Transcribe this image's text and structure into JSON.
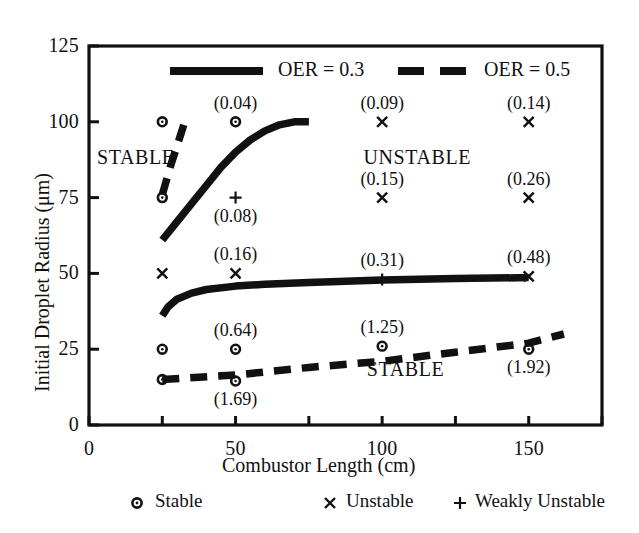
{
  "chart_data": {
    "type": "line",
    "title": "",
    "xlabel": "Combustor Length (cm)",
    "ylabel": "Initial Droplet Radius (μm)",
    "xlim": [
      0,
      175
    ],
    "ylim": [
      0,
      125
    ],
    "xticks": [
      0,
      25,
      50,
      75,
      100,
      125,
      150,
      175
    ],
    "xtick_labels": [
      "0",
      "",
      "50",
      "",
      "100",
      "",
      "150",
      ""
    ],
    "yticks": [
      0,
      25,
      50,
      75,
      100,
      125
    ],
    "ytick_labels": [
      "0",
      "25",
      "50",
      "75",
      "100",
      "125"
    ],
    "grid": false,
    "legend_position": "top-inside",
    "series": [
      {
        "name": "OER = 0.3",
        "style": "solid",
        "branches": [
          {
            "name": "upper-boundary",
            "points": [
              [
                25,
                61
              ],
              [
                30,
                67
              ],
              [
                35,
                73
              ],
              [
                40,
                79
              ],
              [
                45,
                85
              ],
              [
                50,
                90
              ],
              [
                55,
                94
              ],
              [
                60,
                97
              ],
              [
                65,
                99
              ],
              [
                70,
                100
              ],
              [
                75,
                100
              ]
            ]
          },
          {
            "name": "lower-boundary",
            "points": [
              [
                25,
                36
              ],
              [
                27,
                39
              ],
              [
                30,
                41.5
              ],
              [
                35,
                43.5
              ],
              [
                40,
                44.7
              ],
              [
                50,
                45.8
              ],
              [
                60,
                46.4
              ],
              [
                75,
                47
              ],
              [
                100,
                47.8
              ],
              [
                125,
                48.3
              ],
              [
                150,
                48.6
              ]
            ]
          }
        ]
      },
      {
        "name": "OER = 0.5",
        "style": "dashed",
        "branches": [
          {
            "name": "upper-boundary",
            "points": [
              [
                25,
                76
              ],
              [
                28,
                86
              ],
              [
                31,
                95
              ],
              [
                33,
                101
              ]
            ]
          },
          {
            "name": "lower-boundary",
            "points": [
              [
                25,
                15
              ],
              [
                50,
                16.5
              ],
              [
                75,
                19
              ],
              [
                100,
                21
              ],
              [
                125,
                24
              ],
              [
                150,
                27
              ],
              [
                162,
                30
              ]
            ]
          }
        ]
      }
    ],
    "markers": [
      {
        "x": 25,
        "y": 100,
        "type": "stable",
        "symbol": "o",
        "label": ""
      },
      {
        "x": 50,
        "y": 100,
        "type": "stable",
        "symbol": "o",
        "label": "(0.04)",
        "label_pos": "above"
      },
      {
        "x": 100,
        "y": 100,
        "type": "unstable",
        "symbol": "x",
        "label": "(0.09)",
        "label_pos": "above"
      },
      {
        "x": 150,
        "y": 100,
        "type": "unstable",
        "symbol": "x",
        "label": "(0.14)",
        "label_pos": "above"
      },
      {
        "x": 25,
        "y": 75,
        "type": "stable",
        "symbol": "o",
        "label": ""
      },
      {
        "x": 50,
        "y": 75,
        "type": "weakly-unstable",
        "symbol": "+",
        "label": "(0.08)",
        "label_pos": "below"
      },
      {
        "x": 100,
        "y": 75,
        "type": "unstable",
        "symbol": "x",
        "label": "(0.15)",
        "label_pos": "above"
      },
      {
        "x": 150,
        "y": 75,
        "type": "unstable",
        "symbol": "x",
        "label": "(0.26)",
        "label_pos": "above"
      },
      {
        "x": 25,
        "y": 50,
        "type": "unstable",
        "symbol": "x",
        "label": ""
      },
      {
        "x": 50,
        "y": 50,
        "type": "unstable",
        "symbol": "x",
        "label": "(0.16)",
        "label_pos": "above"
      },
      {
        "x": 100,
        "y": 48,
        "type": "weakly-unstable",
        "symbol": "+",
        "label": "(0.31)",
        "label_pos": "above"
      },
      {
        "x": 150,
        "y": 49,
        "type": "unstable",
        "symbol": "x",
        "label": "(0.48)",
        "label_pos": "above"
      },
      {
        "x": 25,
        "y": 25,
        "type": "stable",
        "symbol": "o",
        "label": ""
      },
      {
        "x": 50,
        "y": 25,
        "type": "stable",
        "symbol": "o",
        "label": "(0.64)",
        "label_pos": "above"
      },
      {
        "x": 100,
        "y": 26,
        "type": "stable",
        "symbol": "o",
        "label": "(1.25)",
        "label_pos": "above"
      },
      {
        "x": 150,
        "y": 25,
        "type": "stable",
        "symbol": "o",
        "label": "(1.92)",
        "label_pos": "below"
      },
      {
        "x": 25,
        "y": 15,
        "type": "stable",
        "symbol": "o",
        "label": ""
      },
      {
        "x": 50,
        "y": 14.5,
        "type": "stable",
        "symbol": "o",
        "label": "(1.69)",
        "label_pos": "below"
      }
    ],
    "annotations": [
      {
        "text": "STABLE",
        "x": 16,
        "y": 88
      },
      {
        "text": "UNSTABLE",
        "x": 112,
        "y": 88
      },
      {
        "text": "STABLE",
        "x": 108,
        "y": 18
      }
    ]
  },
  "legend": {
    "entries": [
      {
        "label": "OER = 0.3",
        "style": "solid"
      },
      {
        "label": "OER = 0.5",
        "style": "dashed"
      }
    ]
  },
  "marker_key": {
    "entries": [
      {
        "symbol": "o",
        "label": "Stable",
        "icon": "circle-marker-icon"
      },
      {
        "symbol": "×",
        "label": "Unstable",
        "icon": "cross-marker-icon"
      },
      {
        "symbol": "+",
        "label": "Weakly Unstable",
        "icon": "plus-marker-icon"
      }
    ]
  },
  "colors": {
    "ink": "#111111",
    "background": "#ffffff"
  }
}
